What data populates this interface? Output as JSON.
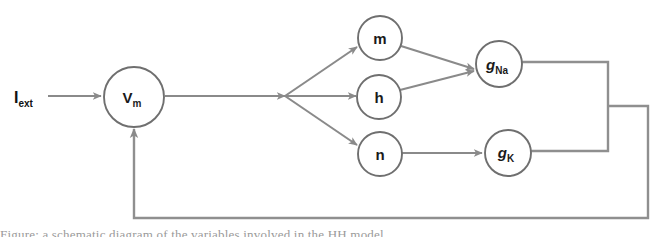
{
  "diagram": {
    "type": "flow-diagram",
    "background_color": "#ffffff",
    "node_stroke_color": "#6f6f6f",
    "edge_color": "#8a8a8a",
    "text_color": "#1a1a1a",
    "input": {
      "label_base": "I",
      "label_sub": "ext",
      "name": "external-current"
    },
    "nodes": [
      {
        "id": "vm",
        "label_base": "V",
        "label_sub": "m",
        "italic": false,
        "cx": 134,
        "cy": 97,
        "r": 30
      },
      {
        "id": "m",
        "label_base": "m",
        "label_sub": "",
        "italic": false,
        "cx": 380,
        "cy": 38,
        "r": 22
      },
      {
        "id": "h",
        "label_base": "h",
        "label_sub": "",
        "italic": false,
        "cx": 379,
        "cy": 97,
        "r": 22
      },
      {
        "id": "n",
        "label_base": "n",
        "label_sub": "",
        "italic": false,
        "cx": 380,
        "cy": 154,
        "r": 22
      },
      {
        "id": "gna",
        "label_base": "g",
        "label_sub": "Na",
        "italic": true,
        "cx": 499,
        "cy": 64,
        "r": 23
      },
      {
        "id": "gk",
        "label_base": "g",
        "label_sub": "K",
        "italic": true,
        "cx": 508,
        "cy": 153,
        "r": 23
      }
    ],
    "edges": [
      {
        "id": "iext-to-vm",
        "from": "external-current",
        "to": "vm"
      },
      {
        "id": "vm-to-branch",
        "from": "vm",
        "to": "branch-point"
      },
      {
        "id": "branch-to-m",
        "from": "branch-point",
        "to": "m"
      },
      {
        "id": "branch-to-h",
        "from": "branch-point",
        "to": "h"
      },
      {
        "id": "branch-to-n",
        "from": "branch-point",
        "to": "n"
      },
      {
        "id": "m-to-gna",
        "from": "m",
        "to": "gna"
      },
      {
        "id": "h-to-gna",
        "from": "h",
        "to": "gna"
      },
      {
        "id": "n-to-gk",
        "from": "n",
        "to": "gk"
      },
      {
        "id": "gna-to-bus",
        "from": "gna",
        "to": "feedback-bus"
      },
      {
        "id": "gk-to-bus",
        "from": "gk",
        "to": "feedback-bus"
      },
      {
        "id": "bus-to-vm",
        "from": "feedback-bus",
        "to": "vm"
      }
    ],
    "caption_fragment": "Figure: a schematic diagram of the variables involved in the HH model"
  }
}
